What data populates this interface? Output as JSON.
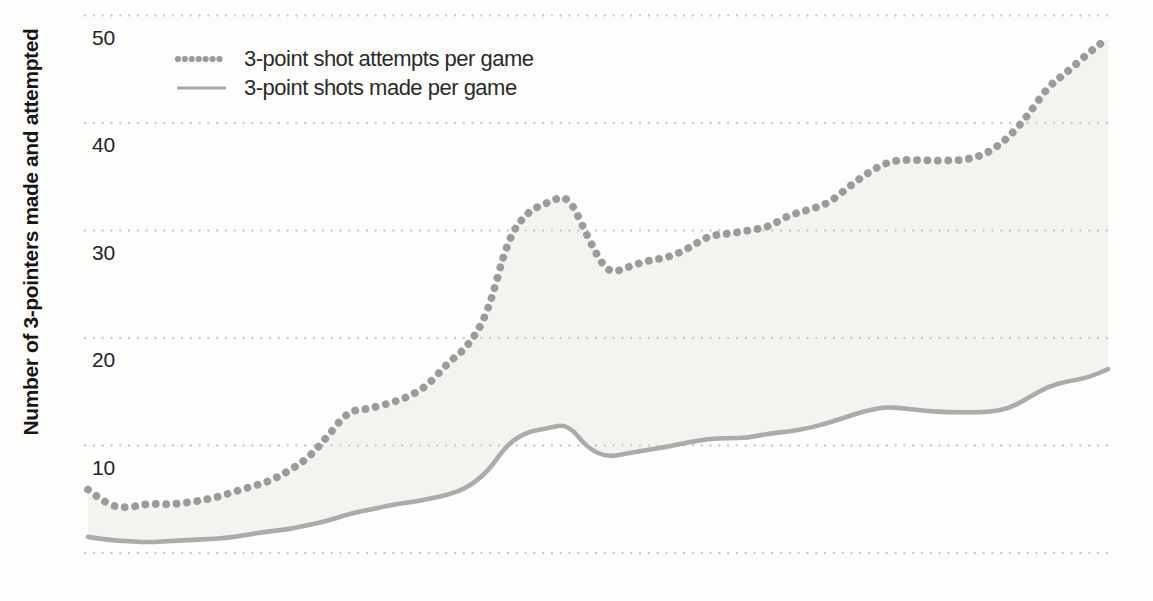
{
  "y_axis": {
    "title": "Number of 3-pointers made and attempted",
    "tick_labels": [
      "10",
      "20",
      "30",
      "40",
      "50"
    ]
  },
  "legend": {
    "items": [
      {
        "label": "3-point shot attempts per game",
        "swatch": "dotted-line"
      },
      {
        "label": "3-point shots made per game",
        "swatch": "solid-line"
      }
    ]
  },
  "chart_data": {
    "type": "line",
    "title": "",
    "xlabel": "",
    "ylabel": "Number of 3-pointers made and attempted",
    "ylim": [
      0,
      52
    ],
    "yticks": [
      10,
      20,
      30,
      40,
      50
    ],
    "gridlines_y": [
      0,
      10,
      20,
      30,
      40,
      50
    ],
    "grid_style": "dotted horizontal lines",
    "x_axis_labels_visible": false,
    "x_note": "unlabeled even time steps (seasons), 52 sampled points left-to-right",
    "legend_position": "top-left inside plot",
    "fill_between_series": true,
    "series": [
      {
        "name": "3-point shot attempts per game",
        "style": "dotted",
        "color": "#9b9b9b",
        "values": [
          5.9,
          4.4,
          4.2,
          4.6,
          4.5,
          4.7,
          5.0,
          5.5,
          6.1,
          6.6,
          7.6,
          8.8,
          10.9,
          13.2,
          13.4,
          13.9,
          14.5,
          15.6,
          17.7,
          19.2,
          22.3,
          29.3,
          31.8,
          32.6,
          33.4,
          29.3,
          25.9,
          26.6,
          27.2,
          27.5,
          28.3,
          29.5,
          29.7,
          30.0,
          30.3,
          31.4,
          31.9,
          32.5,
          34.0,
          35.4,
          36.4,
          36.6,
          36.5,
          36.5,
          36.6,
          37.2,
          38.6,
          40.7,
          43.4,
          44.8,
          46.5,
          47.9
        ]
      },
      {
        "name": "3-point shots made per game",
        "style": "solid",
        "color": "#ababab",
        "values": [
          1.5,
          1.2,
          1.1,
          1.0,
          1.1,
          1.2,
          1.3,
          1.4,
          1.7,
          2.0,
          2.2,
          2.6,
          3.0,
          3.6,
          4.0,
          4.4,
          4.7,
          5.0,
          5.4,
          6.1,
          7.6,
          10.2,
          11.3,
          11.6,
          12.0,
          9.7,
          8.9,
          9.3,
          9.6,
          9.9,
          10.3,
          10.6,
          10.7,
          10.7,
          11.1,
          11.3,
          11.6,
          12.1,
          12.7,
          13.3,
          13.6,
          13.4,
          13.2,
          13.1,
          13.1,
          13.1,
          13.4,
          14.4,
          15.5,
          16.0,
          16.3,
          17.1
        ]
      }
    ],
    "colors": {
      "fill_between": "#f3f3f0",
      "gridline": "#c6c6c6",
      "tick_text": "#242424",
      "axis_title_text": "#161616",
      "legend_text": "#2b2b2b"
    }
  }
}
